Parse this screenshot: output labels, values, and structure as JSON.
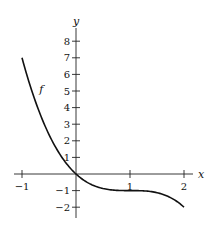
{
  "chart_data": {
    "type": "line",
    "title": "",
    "xlabel": "x",
    "ylabel": "y",
    "xlim": [
      -1.15,
      2.3
    ],
    "ylim": [
      -2.4,
      8.8
    ],
    "x_ticks": [
      -1,
      1,
      2
    ],
    "x_tick_labels": [
      "−1",
      "1",
      "2"
    ],
    "y_ticks": [
      -2,
      -1,
      1,
      2,
      3,
      4,
      5,
      6,
      7,
      8
    ],
    "y_tick_labels": [
      "−2",
      "−1",
      "1",
      "2",
      "3",
      "4",
      "5",
      "6",
      "7",
      "8"
    ],
    "grid": false,
    "series": [
      {
        "name": "f",
        "label": "f",
        "formula": "f(x) = -(x-1)^3 - 1",
        "x": [
          -1,
          -0.75,
          -0.5,
          -0.25,
          0,
          0.25,
          0.5,
          0.75,
          1,
          1.25,
          1.5,
          1.75,
          2
        ],
        "y": [
          7,
          4.36,
          2.38,
          0.95,
          0,
          -0.58,
          -0.88,
          -0.98,
          -1,
          -1.02,
          -1.13,
          -1.42,
          -2
        ]
      }
    ],
    "annotations": [
      {
        "text": "f",
        "x": -0.68,
        "y": 4.9
      }
    ]
  }
}
